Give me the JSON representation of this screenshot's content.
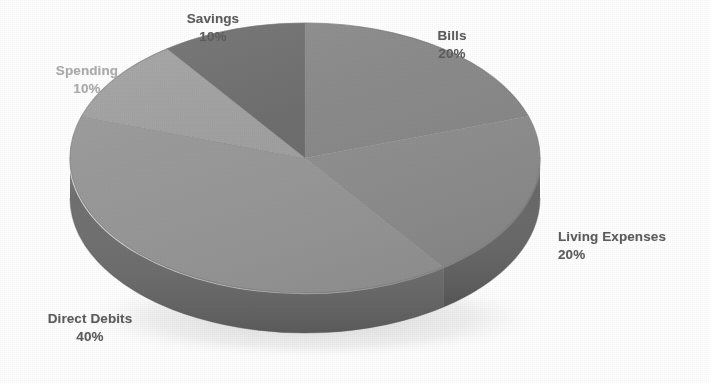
{
  "chart_data": {
    "type": "pie",
    "title": "",
    "subtitle": "",
    "xlabel": "",
    "ylabel": "",
    "legend_position": "none",
    "grid": false,
    "three_d": true,
    "start_angle_deg": 0,
    "direction": "clockwise",
    "categories": [
      "Bills",
      "Living Expenses",
      "Direct Debits",
      "Spending",
      "Savings"
    ],
    "values": [
      20,
      20,
      40,
      10,
      10
    ],
    "value_unit": "%",
    "slices": [
      {
        "name": "Bills",
        "value": 20,
        "value_text": "20%",
        "start_deg": 0,
        "end_deg": 72,
        "color": "#878787",
        "side_color": "#5f5f5f",
        "label_color": "#5d5d5d"
      },
      {
        "name": "Living Expenses",
        "value": 20,
        "value_text": "20%",
        "start_deg": 72,
        "end_deg": 144,
        "color": "#8d8d8d",
        "side_color": "#656565",
        "label_color": "#5d5d5d"
      },
      {
        "name": "Direct Debits",
        "value": 40,
        "value_text": "40%",
        "start_deg": 144,
        "end_deg": 288,
        "color": "#969696",
        "side_color": "#6c6c6c",
        "label_color": "#5d5d5d"
      },
      {
        "name": "Spending",
        "value": 10,
        "value_text": "10%",
        "start_deg": 288,
        "end_deg": 324,
        "color": "#9e9e9e",
        "side_color": "#747474",
        "label_color": "#acacac"
      },
      {
        "name": "Savings",
        "value": 10,
        "value_text": "10%",
        "start_deg": 324,
        "end_deg": 360,
        "color": "#6a6a6a",
        "side_color": "#4f4f4f",
        "label_color": "#5d5d5d"
      }
    ],
    "labels": [
      {
        "id": "savings",
        "name": "Savings",
        "value_text": "10%"
      },
      {
        "id": "bills",
        "name": "Bills",
        "value_text": "20%"
      },
      {
        "id": "spending",
        "name": "Spending",
        "value_text": "10%"
      },
      {
        "id": "living",
        "name": "Living Expenses",
        "value_text": "20%"
      },
      {
        "id": "direct_debits",
        "name": "Direct Debits",
        "value_text": "40%"
      }
    ],
    "colors": {
      "background": "#ffffff",
      "label_text": "#5d5d5d",
      "label_text_faded": "#acacac",
      "rim_highlight": "#d3d3d3",
      "shadow": "#d8d8d8"
    },
    "geometry": {
      "center_x": 305,
      "center_y": 158,
      "radius_x": 235,
      "radius_y": 135,
      "depth": 40
    }
  }
}
